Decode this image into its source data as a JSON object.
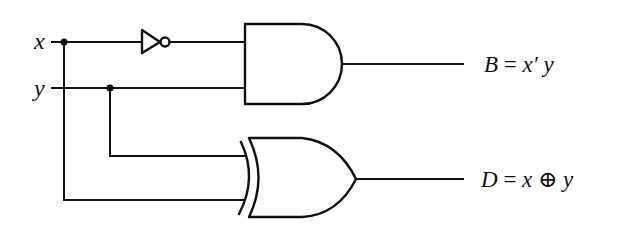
{
  "diagram": {
    "type": "logic-circuit",
    "inputs": [
      {
        "name": "x",
        "label": "x"
      },
      {
        "name": "y",
        "label": "y"
      }
    ],
    "gates": [
      {
        "id": "not1",
        "type": "NOT",
        "input": "x"
      },
      {
        "id": "and1",
        "type": "AND",
        "inputs": [
          "not1",
          "y"
        ],
        "output": "B"
      },
      {
        "id": "xor1",
        "type": "XOR",
        "inputs": [
          "y",
          "x"
        ],
        "output": "D"
      }
    ],
    "outputs": [
      {
        "name": "B",
        "label_var": "B",
        "label_eq": " = ",
        "label_expr": "x′ y"
      },
      {
        "name": "D",
        "label_var": "D",
        "label_eq": " = ",
        "label_expr": "x ⊕ y"
      }
    ]
  }
}
